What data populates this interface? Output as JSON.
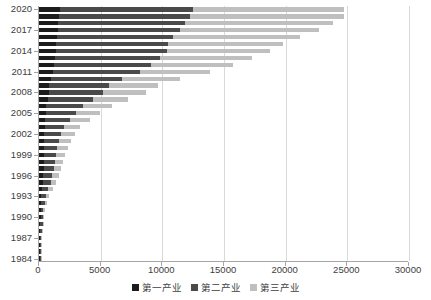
{
  "chart_data": {
    "type": "bar",
    "orientation": "horizontal",
    "stacked": true,
    "title": "",
    "subtitle": "",
    "xlabel": "",
    "ylabel": "",
    "xlim": [
      0,
      30000
    ],
    "xticks": [
      0,
      5000,
      10000,
      15000,
      20000,
      25000,
      30000
    ],
    "xtick_labels": [
      "0",
      "5000",
      "10000",
      "15000",
      "20000",
      "25000",
      "30000"
    ],
    "grid": true,
    "grid_axis": "x",
    "legend_position": "bottom",
    "categories": [
      "1984",
      "1985",
      "1986",
      "1987",
      "1988",
      "1989",
      "1990",
      "1991",
      "1992",
      "1993",
      "1994",
      "1995",
      "1996",
      "1997",
      "1998",
      "1999",
      "2000",
      "2001",
      "2002",
      "2003",
      "2004",
      "2005",
      "2006",
      "2007",
      "2008",
      "2009",
      "2010",
      "2011",
      "2012",
      "2013",
      "2014",
      "2015",
      "2016",
      "2017",
      "2018",
      "2019",
      "2020"
    ],
    "ytick_labels": [
      "1984",
      "1987",
      "1990",
      "1993",
      "1996",
      "1999",
      "2002",
      "2005",
      "2008",
      "2011",
      "2014",
      "2017",
      "2020"
    ],
    "ytick_step": 3,
    "series": [
      {
        "name": "第一产业",
        "color": "#1c1c1c",
        "values": [
          55,
          62,
          70,
          82,
          100,
          115,
          130,
          140,
          158,
          185,
          240,
          300,
          345,
          365,
          380,
          385,
          395,
          410,
          430,
          455,
          520,
          560,
          600,
          690,
          800,
          840,
          950,
          1100,
          1200,
          1280,
          1350,
          1400,
          1450,
          1500,
          1540,
          1620,
          1700
        ]
      },
      {
        "name": "第二产业",
        "color": "#4a4a4a",
        "values": [
          70,
          82,
          95,
          115,
          150,
          175,
          195,
          225,
          290,
          390,
          520,
          640,
          740,
          830,
          890,
          960,
          1090,
          1200,
          1350,
          1600,
          1980,
          2400,
          2950,
          3650,
          4400,
          4800,
          5800,
          7100,
          7900,
          8500,
          9000,
          9100,
          9400,
          9900,
          10300,
          10600,
          10800
        ]
      },
      {
        "name": "第三产业",
        "color": "#bfbfbf",
        "values": [
          35,
          42,
          52,
          65,
          85,
          100,
          115,
          140,
          185,
          250,
          340,
          440,
          520,
          590,
          660,
          740,
          840,
          960,
          1100,
          1300,
          1600,
          1950,
          2350,
          2900,
          3500,
          4000,
          4700,
          5700,
          6600,
          7500,
          8400,
          9300,
          10300,
          11300,
          12000,
          12500,
          12200
        ]
      }
    ],
    "totals": [
      160,
      186,
      217,
      262,
      335,
      390,
      440,
      505,
      633,
      825,
      1100,
      1380,
      1605,
      1785,
      1930,
      2085,
      2325,
      2570,
      2880,
      3355,
      4100,
      4910,
      5900,
      7240,
      8700,
      9640,
      11450,
      13900,
      15700,
      17280,
      18750,
      19800,
      21150,
      22700,
      23840,
      24720,
      24700
    ]
  },
  "legend": {
    "items": [
      {
        "label": "第一产业",
        "color": "#1c1c1c"
      },
      {
        "label": "第二产业",
        "color": "#4a4a4a"
      },
      {
        "label": "第三产业",
        "color": "#bfbfbf"
      }
    ]
  }
}
